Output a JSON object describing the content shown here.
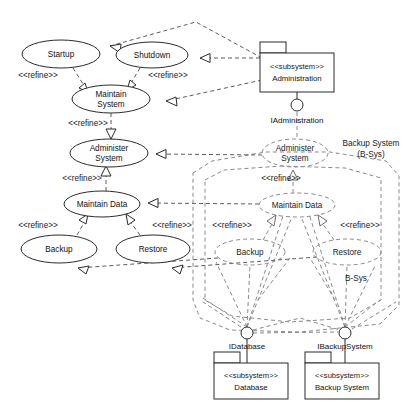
{
  "diagram": {
    "kind": "uml-use-case-diagram",
    "canvas": {
      "width": 410,
      "height": 412
    },
    "colors": {
      "background": "#ffffff",
      "solid_stroke": "#2b2b2b",
      "dashed_stroke": "#8a8a8a",
      "text": "#111111"
    }
  },
  "use_cases": {
    "startup": {
      "label": "Startup",
      "style": "solid",
      "cx": 61,
      "cy": 54,
      "rx": 39,
      "ry": 14
    },
    "shutdown": {
      "label": "Shutdown",
      "style": "solid",
      "cx": 152,
      "cy": 55,
      "rx": 36,
      "ry": 13
    },
    "maintain_system": {
      "label_line1": "Maintain",
      "label_line2": "System",
      "style": "solid",
      "cx": 111,
      "cy": 99,
      "rx": 39,
      "ry": 14
    },
    "administer_system": {
      "label_line1": "Administer",
      "label_line2": "System",
      "style": "solid",
      "cx": 109,
      "cy": 153,
      "rx": 39,
      "ry": 14
    },
    "maintain_data": {
      "label": "Maintain Data",
      "style": "solid",
      "cx": 102,
      "cy": 204,
      "rx": 38,
      "ry": 13
    },
    "backup": {
      "label": "Backup",
      "style": "solid",
      "cx": 59,
      "cy": 249,
      "rx": 38,
      "ry": 14
    },
    "restore": {
      "label": "Restore",
      "style": "solid",
      "cx": 153,
      "cy": 249,
      "rx": 37,
      "ry": 14
    },
    "administer_system_bsys": {
      "label_line1": "Administer",
      "label_line2": "System",
      "style": "dashed",
      "cx": 295,
      "cy": 153,
      "rx": 33,
      "ry": 14
    },
    "maintain_data_bsys": {
      "label": "Maintain Data",
      "style": "dashed",
      "cx": 297,
      "cy": 205,
      "rx": 38,
      "ry": 12
    },
    "backup_bsys": {
      "label": "Backup",
      "style": "dashed",
      "cx": 250,
      "cy": 252,
      "rx": 35,
      "ry": 13
    },
    "restore_bsys": {
      "label": "Restore",
      "style": "dashed",
      "cx": 347,
      "cy": 252,
      "rx": 34,
      "ry": 13
    }
  },
  "subsystems": {
    "administration": {
      "stereotype": "<<subsystem>>",
      "name": "Administration",
      "x": 260,
      "y": 53,
      "w": 74,
      "h": 39
    },
    "database": {
      "stereotype": "<<subsystem>>",
      "name": "Database",
      "x": 214,
      "y": 363,
      "w": 74,
      "h": 36
    },
    "backup_system": {
      "stereotype": "<<subsystem>>",
      "name": "Backup System",
      "x": 305,
      "y": 363,
      "w": 74,
      "h": 36
    }
  },
  "interfaces": {
    "iadministration": {
      "label": "IAdministration",
      "cx": 297,
      "cy": 105,
      "r": 6
    },
    "idatabase": {
      "label": "IDatabase",
      "cx": 247,
      "cy": 333,
      "r": 6
    },
    "ibackupsystem": {
      "label": "IBackupSystem",
      "cx": 345,
      "cy": 333,
      "r": 6
    }
  },
  "boundaries": {
    "backup_system_outer": {
      "label_line1": "Backup System",
      "label_line2": "(B-Sys)",
      "label_x": 371,
      "label_y": 146
    },
    "bsys_inner": {
      "label": "B-Sys",
      "label_x": 356,
      "label_y": 281
    }
  },
  "stereotype_labels": {
    "refine": "<<refine>>"
  },
  "refine_label_positions": [
    {
      "text": "<<refine>>",
      "x": 38,
      "y": 78,
      "anchor": "middle"
    },
    {
      "text": "<<refine>>",
      "x": 168,
      "y": 78,
      "anchor": "middle"
    },
    {
      "text": "<<refine>>",
      "x": 88,
      "y": 126,
      "anchor": "middle"
    },
    {
      "text": "<<refine>>",
      "x": 82,
      "y": 181,
      "anchor": "middle"
    },
    {
      "text": "<<refine>>",
      "x": 38,
      "y": 228,
      "anchor": "middle"
    },
    {
      "text": "<<refine>>",
      "x": 172,
      "y": 228,
      "anchor": "middle"
    },
    {
      "text": "<<refine>>",
      "x": 281,
      "y": 181,
      "anchor": "middle"
    },
    {
      "text": "<<refine>>",
      "x": 232,
      "y": 228,
      "anchor": "middle"
    },
    {
      "text": "<<refine>>",
      "x": 360,
      "y": 228,
      "anchor": "middle"
    }
  ],
  "relationships": [
    {
      "from": "startup",
      "to": "maintain_system",
      "type": "refine"
    },
    {
      "from": "shutdown",
      "to": "maintain_system",
      "type": "refine"
    },
    {
      "from": "maintain_system",
      "to": "administer_system",
      "type": "refine"
    },
    {
      "from": "administer_system",
      "to": "maintain_data",
      "type": "refine"
    },
    {
      "from": "maintain_data",
      "to": "backup",
      "type": "refine"
    },
    {
      "from": "maintain_data",
      "to": "restore",
      "type": "refine"
    },
    {
      "from": "administer_system_bsys",
      "to": "maintain_data_bsys",
      "type": "refine"
    },
    {
      "from": "maintain_data_bsys",
      "to": "backup_bsys",
      "type": "refine"
    },
    {
      "from": "maintain_data_bsys",
      "to": "restore_bsys",
      "type": "refine"
    },
    {
      "from": "administration",
      "to": "startup",
      "type": "realization"
    },
    {
      "from": "administration",
      "to": "shutdown",
      "type": "realization"
    },
    {
      "from": "administration",
      "to": "maintain_system",
      "type": "realization"
    },
    {
      "from": "administer_system_bsys",
      "to": "administer_system",
      "type": "realization"
    },
    {
      "from": "maintain_data_bsys",
      "to": "maintain_data",
      "type": "realization"
    },
    {
      "from": "backup_bsys",
      "to": "backup",
      "type": "realization"
    },
    {
      "from": "restore_bsys",
      "to": "restore",
      "type": "realization"
    }
  ]
}
